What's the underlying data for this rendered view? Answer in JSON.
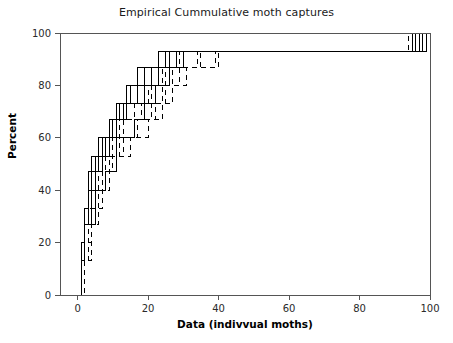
{
  "chart_data": {
    "type": "line",
    "subtype": "empirical-cumulative-distribution-step",
    "title": "Empirical Cummulative moth captures",
    "xlabel": "Data (indivvual moths)",
    "ylabel": "Percent",
    "xlim": [
      -5,
      100
    ],
    "ylim": [
      0,
      100
    ],
    "xticks": [
      0,
      20,
      40,
      60,
      80,
      100
    ],
    "yticks": [
      0,
      20,
      40,
      60,
      80,
      100
    ],
    "xtick_labels": [
      "0",
      "20",
      "40",
      "60",
      "80",
      "100"
    ],
    "ytick_labels": [
      "0",
      "20",
      "40",
      "60",
      "80",
      "100"
    ],
    "grid": false,
    "legend": false,
    "legend_position": "none",
    "line_color": "#000000",
    "background_color": "#ffffff",
    "frame": true,
    "series": [
      {
        "name": "trap-1",
        "style": "solid",
        "x": [
          0,
          1,
          2,
          3,
          4,
          6,
          8,
          11,
          14,
          17,
          21,
          26,
          33,
          44,
          97
        ],
        "y": [
          0,
          13,
          27,
          40,
          47,
          53,
          60,
          67,
          73,
          80,
          87,
          93,
          93,
          93,
          100
        ]
      },
      {
        "name": "trap-2",
        "style": "dashed",
        "x": [
          0,
          1,
          2,
          3,
          5,
          7,
          9,
          12,
          16,
          20,
          24,
          29,
          36,
          48,
          96
        ],
        "y": [
          0,
          7,
          20,
          33,
          40,
          53,
          60,
          67,
          73,
          80,
          87,
          93,
          93,
          93,
          100
        ]
      },
      {
        "name": "trap-3",
        "style": "solid",
        "x": [
          0,
          1,
          2,
          3,
          4,
          5,
          7,
          10,
          13,
          15,
          19,
          23,
          31,
          41,
          95
        ],
        "y": [
          0,
          20,
          33,
          40,
          47,
          53,
          60,
          67,
          73,
          80,
          87,
          93,
          93,
          93,
          100
        ]
      },
      {
        "name": "trap-4",
        "style": "dashed",
        "x": [
          0,
          2,
          3,
          4,
          6,
          8,
          10,
          13,
          18,
          22,
          27,
          34,
          45,
          84,
          96
        ],
        "y": [
          0,
          13,
          27,
          33,
          47,
          53,
          60,
          67,
          73,
          80,
          87,
          93,
          93,
          93,
          100
        ]
      },
      {
        "name": "trap-5",
        "style": "solid",
        "x": [
          0,
          1,
          2,
          4,
          5,
          7,
          9,
          11,
          15,
          18,
          23,
          28,
          38,
          50,
          98
        ],
        "y": [
          0,
          13,
          27,
          40,
          47,
          53,
          60,
          73,
          80,
          80,
          87,
          93,
          93,
          93,
          100
        ]
      },
      {
        "name": "trap-6",
        "style": "dashed",
        "x": [
          0,
          1,
          3,
          5,
          8,
          12,
          16,
          21,
          24,
          26,
          30,
          35,
          42,
          47,
          94
        ],
        "y": [
          0,
          13,
          27,
          40,
          53,
          60,
          67,
          73,
          80,
          87,
          87,
          93,
          93,
          93,
          100
        ]
      },
      {
        "name": "trap-7",
        "style": "solid",
        "x": [
          0,
          1,
          2,
          3,
          5,
          6,
          9,
          12,
          14,
          17,
          20,
          25,
          32,
          46,
          99
        ],
        "y": [
          0,
          20,
          33,
          47,
          53,
          60,
          67,
          73,
          80,
          87,
          87,
          93,
          93,
          93,
          100
        ]
      },
      {
        "name": "trap-8",
        "style": "dashed",
        "x": [
          0,
          2,
          4,
          6,
          9,
          13,
          17,
          22,
          25,
          29,
          33,
          40,
          52,
          82,
          97
        ],
        "y": [
          0,
          13,
          27,
          40,
          53,
          60,
          67,
          73,
          80,
          87,
          87,
          93,
          93,
          93,
          100
        ]
      },
      {
        "name": "trap-9",
        "style": "solid",
        "x": [
          0,
          1,
          2,
          3,
          4,
          7,
          10,
          14,
          19,
          23,
          28,
          37,
          49,
          62,
          96
        ],
        "y": [
          0,
          13,
          33,
          40,
          53,
          60,
          67,
          73,
          80,
          87,
          93,
          93,
          93,
          93,
          100
        ]
      },
      {
        "name": "trap-10",
        "style": "dashed",
        "x": [
          0,
          1,
          3,
          6,
          10,
          15,
          20,
          24,
          27,
          31,
          39,
          43,
          55,
          70,
          98
        ],
        "y": [
          0,
          20,
          33,
          47,
          53,
          60,
          67,
          73,
          80,
          87,
          93,
          93,
          93,
          93,
          100
        ]
      },
      {
        "name": "trap-11",
        "style": "solid",
        "x": [
          0,
          1,
          2,
          5,
          8,
          11,
          16,
          19,
          22,
          26,
          30,
          36,
          44,
          58,
          95
        ],
        "y": [
          0,
          13,
          27,
          40,
          47,
          60,
          67,
          73,
          80,
          87,
          93,
          93,
          93,
          93,
          100
        ]
      },
      {
        "name": "trap-12",
        "style": "dashed",
        "x": [
          0,
          2,
          3,
          4,
          7,
          9,
          12,
          18,
          21,
          25,
          29,
          34,
          41,
          51,
          99
        ],
        "y": [
          0,
          13,
          20,
          33,
          47,
          53,
          67,
          73,
          80,
          87,
          93,
          93,
          93,
          93,
          100
        ]
      }
    ]
  }
}
